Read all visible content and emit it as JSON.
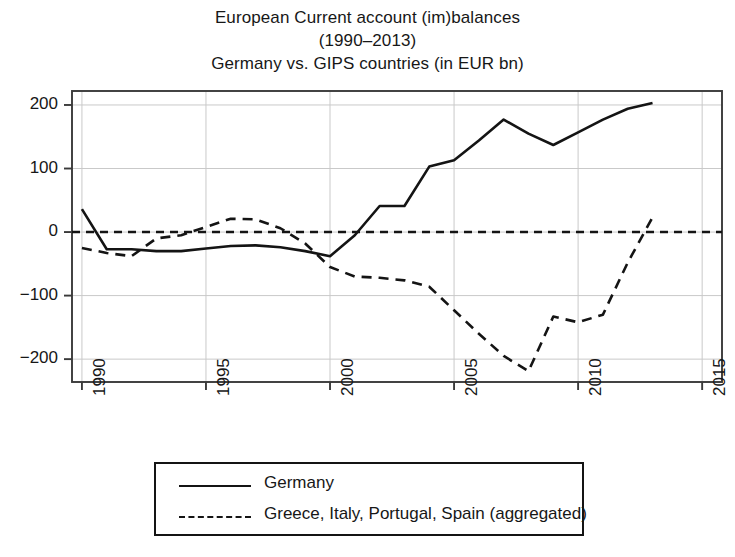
{
  "title": {
    "line1": "European Current account (im)balances",
    "line2": "(1990–2013)",
    "line3": "Germany vs. GIPS countries (in EUR bn)"
  },
  "axes": {
    "y_ticks": [
      "200",
      "100",
      "0",
      "−100",
      "−200"
    ],
    "x_ticks": [
      "1990",
      "1995",
      "2000",
      "2005",
      "2010",
      "2015"
    ]
  },
  "legend": {
    "items": [
      {
        "label": "Germany",
        "style": "solid"
      },
      {
        "label": "Greece, Italy, Portugal, Spain (aggregated)",
        "style": "dashed"
      }
    ]
  },
  "colors": {
    "line": "#141414",
    "frame": "#3a3a3a",
    "grid": "#c9c9c9",
    "background": "#ffffff"
  },
  "chart_data": {
    "type": "line",
    "xlabel": "",
    "ylabel": "EUR bn",
    "xlim": [
      1989.6,
      2015.8
    ],
    "ylim": [
      -236,
      222
    ],
    "grid": true,
    "legend_position": "below-plot",
    "y_ticks": [
      200,
      100,
      0,
      -100,
      -200
    ],
    "x_ticks": [
      1990,
      1995,
      2000,
      2005,
      2010,
      2015
    ],
    "zero_reference_line": 0,
    "x": [
      1990,
      1991,
      1992,
      1993,
      1994,
      1995,
      1996,
      1997,
      1998,
      1999,
      2000,
      2001,
      2002,
      2003,
      2004,
      2005,
      2006,
      2007,
      2008,
      2009,
      2010,
      2011,
      2012,
      2013
    ],
    "series": [
      {
        "name": "Germany",
        "style": "solid",
        "values": [
          36,
          -27,
          -27,
          -30,
          -30,
          -26,
          -22,
          -21,
          -24,
          -30,
          -38,
          -5,
          41,
          41,
          103,
          113,
          144,
          177,
          155,
          137,
          157,
          177,
          194,
          203
        ]
      },
      {
        "name": "Greece, Italy, Portugal, Spain (aggregated)",
        "style": "dashed",
        "values": [
          -25,
          -33,
          -38,
          -10,
          -5,
          8,
          21,
          20,
          6,
          -18,
          -55,
          -70,
          -72,
          -76,
          -86,
          -123,
          -160,
          -195,
          -219,
          -133,
          -142,
          -130,
          -48,
          23
        ]
      }
    ]
  }
}
